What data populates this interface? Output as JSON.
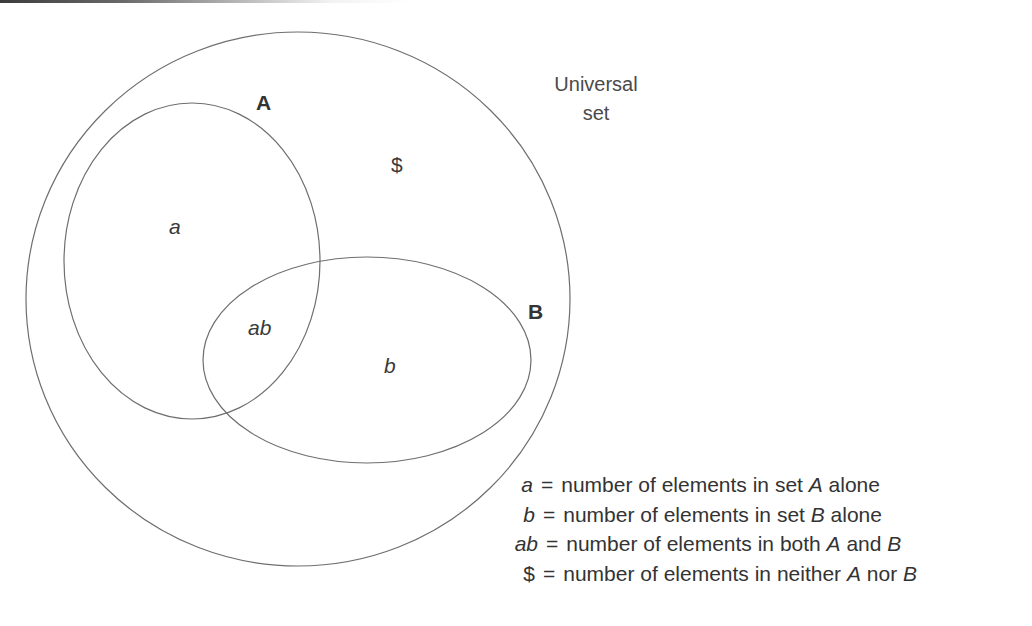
{
  "diagram": {
    "type": "venn",
    "universal_label_line1": "Universal",
    "universal_label_line2": "set",
    "set_a_label": "A",
    "set_b_label": "B",
    "regions": {
      "a_only": "a",
      "b_only": "b",
      "both": "ab",
      "neither": "$"
    },
    "colors": {
      "stroke": "#6e6e6e",
      "text": "#3a3a3a",
      "background": "#ffffff"
    }
  },
  "legend": {
    "rows": [
      {
        "symbol": "a",
        "equals": "=",
        "text_before": "number of elements in set ",
        "var1": "A",
        "text_mid": " alone",
        "var2": "",
        "text_after": ""
      },
      {
        "symbol": "b",
        "equals": "=",
        "text_before": "number of elements in set ",
        "var1": "B",
        "text_mid": " alone",
        "var2": "",
        "text_after": ""
      },
      {
        "symbol": "ab",
        "equals": "=",
        "text_before": "number of elements in both ",
        "var1": "A",
        "text_mid": " and ",
        "var2": "B",
        "text_after": ""
      },
      {
        "symbol": "$",
        "equals": "=",
        "text_before": "number of elements in neither ",
        "var1": "A",
        "text_mid": " nor ",
        "var2": "B",
        "text_after": ""
      }
    ]
  }
}
